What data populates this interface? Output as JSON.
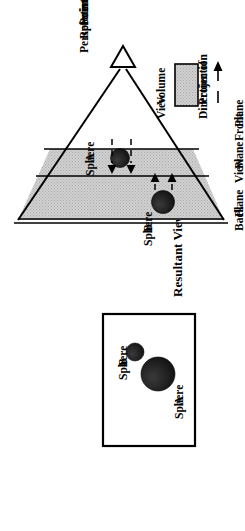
{
  "figure": {
    "orientation": "rotated-90-ccw",
    "colors": {
      "view_volume_fill": "#c8c8c8",
      "sphere_fill": "#1a1a1a",
      "line": "#000000",
      "background": "#ffffff"
    }
  },
  "resultant_view_panel": {
    "caption": "Resultant View",
    "sphere_a_label_line1": "Sphere",
    "sphere_a_label_line2": "A",
    "sphere_b_label_line1": "Sphere",
    "sphere_b_label_line2": "B"
  },
  "view_volume_diagram": {
    "sphere_a_label_line1": "Sphere",
    "sphere_a_label_line2": "A",
    "sphere_b_label_line1": "Sphere",
    "sphere_b_label_line2": "B",
    "back_plane_line1": "Back",
    "back_plane_line2": "Plane",
    "view_plane_line1": "View",
    "view_plane_line2": "Plane",
    "front_plane_line1": "Front",
    "front_plane_line2": "Plane",
    "prp_line1": "Perspective",
    "prp_line2": "Reference",
    "prp_line3": "Point"
  },
  "legend": {
    "view_volume_line1": "View",
    "view_volume_line2": "Volume",
    "direction_line1": "Direction of",
    "direction_line2": "Projection"
  }
}
